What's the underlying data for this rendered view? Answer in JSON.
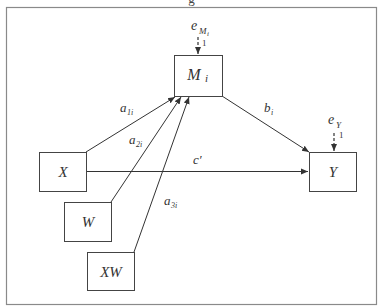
{
  "figure": {
    "caption_fragment": "g",
    "frame_color": "#8a8a8a",
    "line_color": "#333333"
  },
  "nodes": {
    "X": {
      "label": "X",
      "x": 39,
      "y": 152,
      "w": 47,
      "h": 39
    },
    "W": {
      "label": "W",
      "x": 64,
      "y": 202,
      "w": 47,
      "h": 39
    },
    "XW": {
      "label": "XW",
      "x": 87,
      "y": 252,
      "w": 47,
      "h": 38
    },
    "M": {
      "label": "M",
      "sub": "i",
      "x": 174,
      "y": 55,
      "w": 48,
      "h": 41
    },
    "Y": {
      "label": "Y",
      "x": 309,
      "y": 152,
      "w": 47,
      "h": 39
    }
  },
  "errors": {
    "eM": {
      "label": "e",
      "sub": "M",
      "subsub": "i",
      "weight": "1"
    },
    "eY": {
      "label": "e",
      "sub": "Y",
      "weight": "1"
    }
  },
  "paths": {
    "a1": {
      "label": "a",
      "sub": "1i",
      "from": "X",
      "to": "M"
    },
    "a2": {
      "label": "a",
      "sub": "2i",
      "from": "W",
      "to": "M"
    },
    "a3": {
      "label": "a",
      "sub": "3i",
      "from": "XW",
      "to": "M"
    },
    "b": {
      "label": "b",
      "sub": "i",
      "from": "M",
      "to": "Y"
    },
    "c": {
      "label": "c′",
      "from": "X",
      "to": "Y"
    }
  }
}
